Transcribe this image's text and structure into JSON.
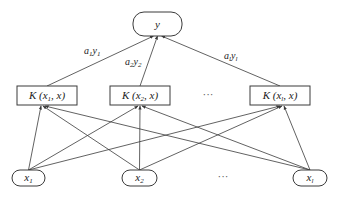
{
  "diagram": {
    "title": "",
    "type": "kernel-network",
    "output_node": {
      "id": "y",
      "label": "y",
      "shape": "pill",
      "x": 133,
      "y": 12,
      "w": 49,
      "h": 24
    },
    "kernel_nodes": [
      {
        "id": "k1",
        "label_main": "K (x",
        "label_sub": "1",
        "label_tail": ", x)",
        "x": 17,
        "y": 86,
        "w": 60,
        "h": 19
      },
      {
        "id": "k2",
        "label_main": "K (x",
        "label_sub": "2",
        "label_tail": ", x)",
        "x": 110,
        "y": 86,
        "w": 60,
        "h": 19
      },
      {
        "id": "kl",
        "label_main": "K (x",
        "label_sub": "l",
        "label_tail": ", x)",
        "x": 250,
        "y": 86,
        "w": 60,
        "h": 19
      }
    ],
    "kernel_ellipsis": {
      "text": "···",
      "x": 208,
      "y": 98
    },
    "input_nodes": [
      {
        "id": "x1",
        "label_main": "x",
        "label_sub": "1",
        "x": 12,
        "y": 170,
        "w": 33,
        "h": 16
      },
      {
        "id": "x2",
        "label_main": "x",
        "label_sub": "2",
        "x": 122,
        "y": 170,
        "w": 35,
        "h": 16
      },
      {
        "id": "xl",
        "label_main": "x",
        "label_sub": "l",
        "x": 293,
        "y": 170,
        "w": 34,
        "h": 16
      }
    ],
    "input_ellipsis": {
      "text": "···",
      "x": 223,
      "y": 180
    },
    "output_edges": [
      {
        "from": "k1",
        "label_a": "a",
        "label_a_sub": "1",
        "label_y": "y",
        "label_y_sub": "1",
        "lx": 84,
        "ly": 54
      },
      {
        "from": "k2",
        "label_a": "a",
        "label_a_sub": "2",
        "label_y": "y",
        "label_y_sub": "2",
        "lx": 125,
        "ly": 65
      },
      {
        "from": "kl",
        "label_a": "a",
        "label_a_sub": "l",
        "label_y": "y",
        "label_y_sub": "l",
        "lx": 224,
        "ly": 59
      }
    ],
    "input_edges": "fully-connected: every input node -> every kernel node"
  }
}
